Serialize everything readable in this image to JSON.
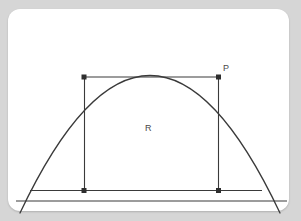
{
  "page": {
    "background_color": "#d6d6d6",
    "card_color": "#ffffff",
    "ink_color": "#3a3a3a"
  },
  "diagram": {
    "labels": {
      "point_P": "P",
      "region_R": "R"
    },
    "curve": {
      "name": "parabola",
      "apex": {
        "x": 150,
        "y": 25
      },
      "left_root": {
        "x": 27,
        "y": 200
      },
      "right_root": {
        "x": 273,
        "y": 200
      }
    },
    "rectangle": {
      "left": 84,
      "right": 218,
      "top": 77,
      "bottom": 190,
      "vertices": [
        {
          "name": "top-left",
          "x": 84,
          "y": 77
        },
        {
          "name": "top-right",
          "x": 218,
          "y": 77
        },
        {
          "name": "bottom-right",
          "x": 218,
          "y": 190
        },
        {
          "name": "bottom-left",
          "x": 84,
          "y": 190
        }
      ],
      "marked_vertices": [
        "top-left",
        "top-right",
        "bottom-right",
        "bottom-left"
      ]
    },
    "baseline": {
      "y": 190,
      "x1": 30,
      "x2": 262
    },
    "axis_line": {
      "y": 201,
      "x1": 16,
      "x2": 287
    }
  }
}
